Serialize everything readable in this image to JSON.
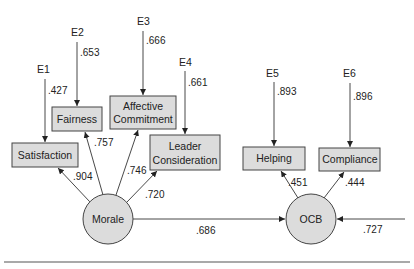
{
  "diagram": {
    "type": "structural-equation-model",
    "latent": {
      "morale": "Morale",
      "ocb": "OCB"
    },
    "indicators": {
      "satisfaction": "Satisfaction",
      "fairness": "Fairness",
      "affective_1": "Affective",
      "affective_2": "Commitment",
      "leader_1": "Leader",
      "leader_2": "Consideration",
      "helping": "Helping",
      "compliance": "Compliance"
    },
    "errors": {
      "e1": "E1",
      "e2": "E2",
      "e3": "E3",
      "e4": "E4",
      "e5": "E5",
      "e6": "E6"
    },
    "error_paths": {
      "e1": ".427",
      "e2": ".653",
      "e3": ".666",
      "e4": ".661",
      "e5": ".893",
      "e6": ".896"
    },
    "loadings": {
      "satisfaction": ".904",
      "fairness": ".757",
      "affective": ".746",
      "leader": ".720",
      "helping": ".451",
      "compliance": ".444"
    },
    "structural": {
      "morale_to_ocb": ".686",
      "ocb_disturbance": ".727"
    },
    "colors": {
      "node_fill": "#dcdcdc",
      "stroke": "#444444",
      "background": "#ffffff"
    }
  }
}
